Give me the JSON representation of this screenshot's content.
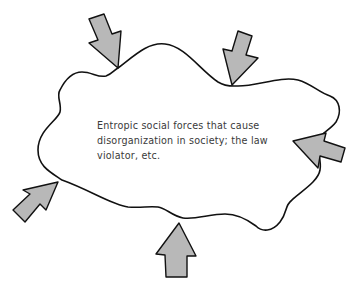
{
  "diagram": {
    "center_text": {
      "lines": [
        "Entropic social forces that cause",
        "disorganization in society; the law",
        "violator, etc."
      ]
    },
    "shape": "irregular-blob",
    "arrows": [
      {
        "id": "top-left",
        "direction": "inward"
      },
      {
        "id": "top-right",
        "direction": "inward"
      },
      {
        "id": "right",
        "direction": "inward"
      },
      {
        "id": "bottom",
        "direction": "inward"
      },
      {
        "id": "bottom-left",
        "direction": "inward"
      }
    ],
    "colors": {
      "outline": "#111111",
      "arrow_fill": "#b8b8b8",
      "text": "#3a3a3a"
    }
  }
}
